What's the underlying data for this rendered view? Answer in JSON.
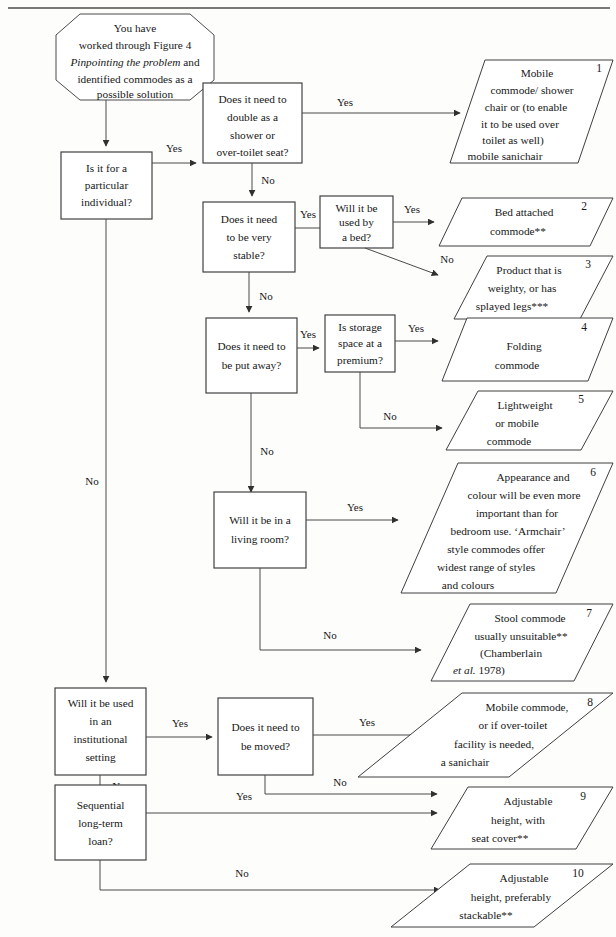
{
  "figure": {
    "type": "flowchart",
    "orientation": "left-to-right decision tree",
    "top_rule": true
  },
  "start": {
    "name": "start-octagon",
    "lines": [
      "You have",
      "worked through Figure 4",
      "Pinpointing the problem and",
      "identified commodes as a",
      "possible solution"
    ],
    "italic_line_index": 2,
    "italic_fragment": "Pinpointing the problem"
  },
  "decisions": [
    {
      "id": "d1",
      "name": "decision-particular-individual",
      "lines": [
        "Is it for a",
        "particular",
        "individual?"
      ]
    },
    {
      "id": "d2",
      "name": "decision-double-as-shower",
      "lines": [
        "Does it need to",
        "double as a",
        "shower or",
        "over-toilet seat?"
      ]
    },
    {
      "id": "d3",
      "name": "decision-very-stable",
      "lines": [
        "Does it need",
        "to be very",
        "stable?"
      ]
    },
    {
      "id": "d4",
      "name": "decision-used-by-bed",
      "lines": [
        "Will it be",
        "used by",
        "a bed?"
      ]
    },
    {
      "id": "d5",
      "name": "decision-put-away",
      "lines": [
        "Does it need to",
        "be put away?"
      ]
    },
    {
      "id": "d6",
      "name": "decision-storage-premium",
      "lines": [
        "Is storage",
        "space at a",
        "premium?"
      ]
    },
    {
      "id": "d7",
      "name": "decision-living-room",
      "lines": [
        "Will it be in a",
        "living room?"
      ]
    },
    {
      "id": "d8",
      "name": "decision-institutional-setting",
      "lines": [
        "Will it be used",
        "in an",
        "institutional",
        "setting"
      ]
    },
    {
      "id": "d9",
      "name": "decision-need-to-be-moved",
      "lines": [
        "Does it need to",
        "be moved?"
      ]
    },
    {
      "id": "d10",
      "name": "decision-sequential-long-term-loan",
      "lines": [
        "Sequential",
        "long-term",
        "loan?"
      ]
    }
  ],
  "outcomes": [
    {
      "number": "1",
      "name": "outcome-mobile-commode-shower-chair",
      "lines": [
        "Mobile",
        "commode/ shower",
        "chair or (to enable",
        "it to be used over",
        "toilet as well)",
        "mobile sanichair"
      ]
    },
    {
      "number": "2",
      "name": "outcome-bed-attached-commode",
      "lines": [
        "Bed attached",
        "commode**"
      ]
    },
    {
      "number": "3",
      "name": "outcome-weighty-splayed-legs",
      "lines": [
        "Product that is",
        "weighty, or has",
        "splayed legs***"
      ]
    },
    {
      "number": "4",
      "name": "outcome-folding-commode",
      "lines": [
        "Folding",
        "commode"
      ]
    },
    {
      "number": "5",
      "name": "outcome-lightweight-mobile-commode",
      "lines": [
        "Lightweight",
        "or mobile",
        "commode"
      ]
    },
    {
      "number": "6",
      "name": "outcome-appearance-and-colour",
      "lines": [
        "Appearance and",
        "colour will be even more",
        "important than for",
        "bedroom use. ‘Armchair’",
        "style commodes offer",
        "widest range of styles",
        "and colours"
      ]
    },
    {
      "number": "7",
      "name": "outcome-stool-commode-unsuitable",
      "lines": [
        "Stool commode",
        "usually unsuitable**",
        "(Chamberlain",
        "et al. 1978)"
      ],
      "italic_fragment": "et al."
    },
    {
      "number": "8",
      "name": "outcome-mobile-commode-or-sanichair",
      "lines": [
        "Mobile commode,",
        "or if over-toilet",
        "facility is needed,",
        "a sanichair"
      ]
    },
    {
      "number": "9",
      "name": "outcome-adjustable-height-seat-cover",
      "lines": [
        "Adjustable",
        "height, with",
        "seat cover**"
      ]
    },
    {
      "number": "10",
      "name": "outcome-adjustable-height-stackable",
      "lines": [
        "Adjustable",
        "height, preferably",
        "stackable**"
      ]
    }
  ],
  "edge_labels": {
    "yes": "Yes",
    "no": "No"
  },
  "edges": [
    {
      "from": "d1",
      "to": "d2",
      "label": "Yes"
    },
    {
      "from": "d1",
      "to": "d8",
      "label": "No"
    },
    {
      "from": "d2",
      "to": "1",
      "label": "Yes"
    },
    {
      "from": "d2",
      "to": "d3",
      "label": "No"
    },
    {
      "from": "d3",
      "to": "d4",
      "label": "Yes"
    },
    {
      "from": "d3",
      "to": "d5",
      "label": "No"
    },
    {
      "from": "d4",
      "to": "2",
      "label": "Yes"
    },
    {
      "from": "d4",
      "to": "3",
      "label": "No"
    },
    {
      "from": "d5",
      "to": "d6",
      "label": "Yes"
    },
    {
      "from": "d5",
      "to": "d7",
      "label": "No"
    },
    {
      "from": "d6",
      "to": "4",
      "label": "Yes"
    },
    {
      "from": "d6",
      "to": "5",
      "label": "No"
    },
    {
      "from": "d7",
      "to": "6",
      "label": "Yes"
    },
    {
      "from": "d7",
      "to": "7",
      "label": "No"
    },
    {
      "from": "d8",
      "to": "d9",
      "label": "Yes"
    },
    {
      "from": "d8",
      "to": "d10",
      "label": "No"
    },
    {
      "from": "d9",
      "to": "8",
      "label": "Yes"
    },
    {
      "from": "d9",
      "to": "9",
      "label": "No"
    },
    {
      "from": "d10",
      "to": "9",
      "label": "Yes"
    },
    {
      "from": "d10",
      "to": "10",
      "label": "No"
    }
  ],
  "colors": {
    "stroke": "#3a3a3a",
    "text": "#171717",
    "background": "#fdfdfc"
  }
}
